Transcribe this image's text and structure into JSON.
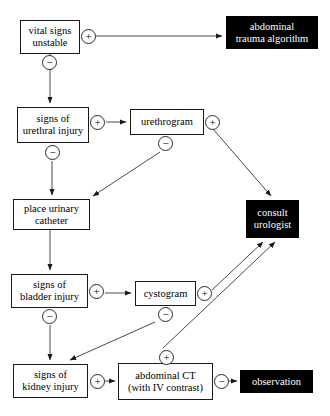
{
  "diagram": {
    "type": "flowchart",
    "canvas": {
      "width": 330,
      "height": 416
    },
    "colors": {
      "terminal_fill": "#000000",
      "terminal_text": "#ffffff",
      "node_fill": "#ffffff",
      "node_stroke": "#1a1a1a",
      "edge_stroke": "#4a4a4a",
      "background": "#ffffff"
    },
    "nodes": [
      {
        "id": "vital_signs",
        "label": "vital signs\nunstable",
        "style": "plain",
        "x": 20,
        "y": 20,
        "w": 60,
        "h": 34,
        "font_size": 10.5
      },
      {
        "id": "abdominal_trauma",
        "label": "abdominal\ntrauma algorithm",
        "style": "terminal",
        "x": 226,
        "y": 16,
        "w": 92,
        "h": 33,
        "font_size": 10.5
      },
      {
        "id": "urethral_injury",
        "label": "signs of\nurethral injury",
        "style": "plain",
        "x": 17,
        "y": 107,
        "w": 72,
        "h": 36,
        "font_size": 10.5
      },
      {
        "id": "urethrogram",
        "label": "urethrogram",
        "style": "plain",
        "x": 130,
        "y": 109,
        "w": 74,
        "h": 26,
        "font_size": 10.5
      },
      {
        "id": "urinary_catheter",
        "label": "place urinary\ncatheter",
        "style": "plain",
        "x": 13,
        "y": 199,
        "w": 77,
        "h": 31,
        "font_size": 10.5
      },
      {
        "id": "consult_urologist",
        "label": "consult\nurologist",
        "style": "terminal",
        "x": 246,
        "y": 200,
        "w": 53,
        "h": 38,
        "font_size": 10.5
      },
      {
        "id": "bladder_injury",
        "label": "signs of\nbladder injury",
        "style": "plain",
        "x": 11,
        "y": 274,
        "w": 77,
        "h": 34,
        "font_size": 10.5
      },
      {
        "id": "cystogram",
        "label": "cystogram",
        "style": "plain",
        "x": 135,
        "y": 281,
        "w": 61,
        "h": 25,
        "font_size": 10.5
      },
      {
        "id": "kidney_injury",
        "label": "signs of\nkidney injury",
        "style": "plain",
        "x": 13,
        "y": 364,
        "w": 75,
        "h": 34,
        "font_size": 10.5
      },
      {
        "id": "abdominal_ct",
        "label": "abdominal CT\n(with IV contrast)",
        "style": "plain",
        "x": 118,
        "y": 363,
        "w": 95,
        "h": 37,
        "font_size": 10.5
      },
      {
        "id": "observation",
        "label": "observation",
        "style": "terminal",
        "x": 240,
        "y": 370,
        "w": 73,
        "h": 23,
        "font_size": 10.5
      }
    ],
    "signs": [
      {
        "id": "s1",
        "symbol": "+",
        "from": "vital_signs",
        "to": "abdominal_trauma",
        "x": 81,
        "y": 29
      },
      {
        "id": "s2",
        "symbol": "−",
        "from": "vital_signs",
        "to": "urethral_injury",
        "x": 42,
        "y": 55
      },
      {
        "id": "s3",
        "symbol": "+",
        "from": "urethral_injury",
        "to": "urethrogram",
        "x": 90,
        "y": 115
      },
      {
        "id": "s4",
        "symbol": "−",
        "from": "urethral_injury",
        "to": "urinary_catheter",
        "x": 45,
        "y": 145
      },
      {
        "id": "s5",
        "symbol": "+",
        "from": "urethrogram",
        "to": "consult_urologist",
        "x": 205,
        "y": 115
      },
      {
        "id": "s6",
        "symbol": "−",
        "from": "urethrogram",
        "to": "urinary_catheter",
        "x": 158,
        "y": 136
      },
      {
        "id": "s7",
        "symbol": "+",
        "from": "bladder_injury",
        "to": "cystogram",
        "x": 89,
        "y": 284
      },
      {
        "id": "s8",
        "symbol": "−",
        "from": "bladder_injury",
        "to": "kidney_injury",
        "x": 42,
        "y": 309
      },
      {
        "id": "s9",
        "symbol": "+",
        "from": "cystogram",
        "to": "consult_urologist",
        "x": 197,
        "y": 286
      },
      {
        "id": "s10",
        "symbol": "−",
        "from": "cystogram",
        "to": "kidney_injury",
        "x": 158,
        "y": 307
      },
      {
        "id": "s11",
        "symbol": "+",
        "from": "abdominal_ct",
        "to": "consult_urologist",
        "x": 159,
        "y": 350
      },
      {
        "id": "s12",
        "symbol": "+",
        "from": "kidney_injury",
        "to": "abdominal_ct",
        "x": 90,
        "y": 374
      },
      {
        "id": "s13",
        "symbol": "−",
        "from": "abdominal_ct",
        "to": "observation",
        "x": 214,
        "y": 374
      }
    ],
    "edges": [
      {
        "id": "e1",
        "from": "vital_signs",
        "to": "abdominal_trauma",
        "sign": "+",
        "points": "96,36 224,36"
      },
      {
        "id": "e2",
        "from": "vital_signs",
        "to": "urethral_injury",
        "sign": "−",
        "points": "50,54 50,105"
      },
      {
        "id": "e3",
        "from": "urethral_injury",
        "to": "urethrogram",
        "sign": "+",
        "points": "105,122 128,122"
      },
      {
        "id": "e4",
        "from": "urethral_injury",
        "to": "urinary_catheter",
        "sign": "−",
        "points": "52,160 52,197"
      },
      {
        "id": "e5",
        "from": "urethrogram",
        "to": "consult_urologist",
        "sign": "+",
        "points": "213,128 272,198"
      },
      {
        "id": "e6",
        "from": "urethrogram",
        "to": "urinary_catheter",
        "sign": "−",
        "points": "160,151 92,197"
      },
      {
        "id": "e7",
        "from": "urinary_catheter",
        "to": "bladder_injury",
        "points": "50,230 50,272"
      },
      {
        "id": "e8",
        "from": "bladder_injury",
        "to": "cystogram",
        "sign": "+",
        "points": "104,293 133,293"
      },
      {
        "id": "e9",
        "from": "bladder_injury",
        "to": "kidney_injury",
        "sign": "−",
        "points": "50,324 50,362"
      },
      {
        "id": "e10",
        "from": "cystogram",
        "to": "consult_urologist",
        "sign": "+",
        "points": "212,290 265,240"
      },
      {
        "id": "e11",
        "from": "cystogram",
        "to": "kidney_injury",
        "sign": "−",
        "points": "155,322 68,362"
      },
      {
        "id": "e12",
        "from": "abdominal_ct",
        "to": "consult_urologist",
        "sign": "+",
        "points": "165,348 274,240"
      },
      {
        "id": "e13",
        "from": "kidney_injury",
        "to": "abdominal_ct",
        "sign": "+",
        "points": "105,381 116,381"
      },
      {
        "id": "e14",
        "from": "abdominal_ct",
        "to": "observation",
        "sign": "−",
        "points": "229,381 238,381"
      }
    ]
  }
}
